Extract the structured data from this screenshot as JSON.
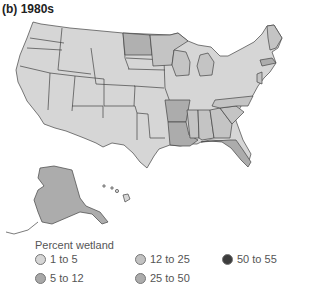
{
  "title": "(b) 1980s",
  "legend": {
    "title": "Percent wetland",
    "items": [
      {
        "label": "1 to 5",
        "color": "#d6d6d6"
      },
      {
        "label": "5 to 12",
        "color": "#a8a8a8"
      },
      {
        "label": "12 to 25",
        "color": "#c2c2c2"
      },
      {
        "label": "25 to 50",
        "color": "#acacac"
      },
      {
        "label": "50 to 55",
        "color": "#3c3c3c"
      }
    ]
  },
  "map": {
    "stroke": "#444444",
    "base_color": "#d6d6d6",
    "highlighted_states": [
      {
        "name": "North Dakota",
        "class": "12 to 25"
      },
      {
        "name": "Minnesota",
        "class": "12 to 25"
      },
      {
        "name": "Wisconsin",
        "class": "12 to 25"
      },
      {
        "name": "Michigan",
        "class": "12 to 25"
      },
      {
        "name": "Arkansas",
        "class": "25 to 50"
      },
      {
        "name": "Louisiana",
        "class": "25 to 50"
      },
      {
        "name": "Mississippi",
        "class": "12 to 25"
      },
      {
        "name": "Alabama",
        "class": "12 to 25"
      },
      {
        "name": "Georgia",
        "class": "12 to 25"
      },
      {
        "name": "South Carolina",
        "class": "12 to 25"
      },
      {
        "name": "North Carolina",
        "class": "12 to 25"
      },
      {
        "name": "Florida",
        "class": "25 to 50"
      },
      {
        "name": "Maine",
        "class": "12 to 25"
      },
      {
        "name": "Massachusetts",
        "class": "25 to 50"
      },
      {
        "name": "New Jersey",
        "class": "12 to 25"
      },
      {
        "name": "Delaware",
        "class": "12 to 25"
      },
      {
        "name": "Alaska",
        "class": "25 to 50"
      }
    ]
  }
}
